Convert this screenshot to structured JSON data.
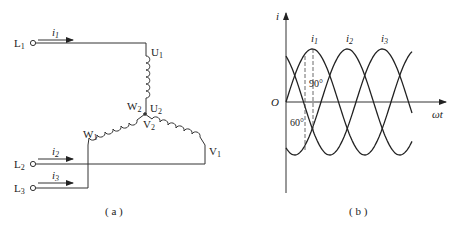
{
  "figure_a": {
    "caption": "( a )",
    "terminals": [
      {
        "name": "L",
        "sub": "1",
        "current": "i",
        "current_sub": "1"
      },
      {
        "name": "L",
        "sub": "2",
        "current": "i",
        "current_sub": "2"
      },
      {
        "name": "L",
        "sub": "3",
        "current": "i",
        "current_sub": "3"
      }
    ],
    "winding_labels": {
      "U1": {
        "t": "U",
        "s": "1"
      },
      "U2": {
        "t": "U",
        "s": "2"
      },
      "V1": {
        "t": "V",
        "s": "1"
      },
      "V2": {
        "t": "V",
        "s": "2"
      },
      "W1": {
        "t": "W",
        "s": "1"
      },
      "W2": {
        "t": "W",
        "s": "2"
      }
    }
  },
  "figure_b": {
    "caption": "( b )",
    "y_axis_label": "i",
    "x_axis_label": "ωt",
    "origin_label": "O",
    "curves": [
      {
        "label": "i",
        "sub": "1",
        "phase_deg": 0
      },
      {
        "label": "i",
        "sub": "2",
        "phase_deg": -120
      },
      {
        "label": "i",
        "sub": "3",
        "phase_deg": -240
      }
    ],
    "annotations": [
      "90°",
      "60°"
    ]
  },
  "chart_data": {
    "type": "line",
    "title": "",
    "xlabel": "ωt",
    "ylabel": "i",
    "x": [
      0,
      30,
      60,
      90,
      120,
      150,
      180,
      210,
      240,
      270,
      300,
      330,
      360,
      390,
      420
    ],
    "series": [
      {
        "name": "i1",
        "values": [
          0,
          0.5,
          0.87,
          1,
          0.87,
          0.5,
          0,
          -0.5,
          -0.87,
          -1,
          -0.87,
          -0.5,
          0,
          0.5,
          0.87
        ]
      },
      {
        "name": "i2",
        "values": [
          -0.87,
          -1,
          -0.87,
          -0.5,
          0,
          0.5,
          0.87,
          1,
          0.87,
          0.5,
          0,
          -0.5,
          -0.87,
          -1,
          -0.87
        ]
      },
      {
        "name": "i3",
        "values": [
          0.87,
          0.5,
          0,
          -0.5,
          -0.87,
          -1,
          -0.87,
          -0.5,
          0,
          0.5,
          0.87,
          1,
          0.87,
          0.5,
          0
        ]
      }
    ],
    "annotations": [
      {
        "text": "90°",
        "x": 90
      },
      {
        "text": "60°",
        "x": 60
      }
    ],
    "grid": false,
    "legend": "inline labels above peaks"
  }
}
